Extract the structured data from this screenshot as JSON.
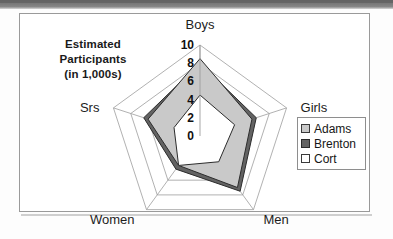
{
  "frame": {
    "border_color": "#9a9a9a",
    "background": "#ffffff"
  },
  "title": {
    "line1": "Estimated",
    "line2": "Participants",
    "line3": "(in 1,000s)"
  },
  "legend": {
    "items": [
      {
        "label": "Adams",
        "color": "#c9c9c9",
        "border": "#3a3a3a"
      },
      {
        "label": "Brenton",
        "color": "#636363",
        "border": "#2b2b2b"
      },
      {
        "label": "Cort",
        "color": "#ffffff",
        "border": "#3a3a3a"
      }
    ]
  },
  "chart_data": {
    "type": "radar",
    "title": "Estimated Participants (in 1,000s)",
    "xlabel": "",
    "ylabel": "Estimated Participants (in 1,000s)",
    "categories": [
      "Boys",
      "Girls",
      "Men",
      "Women",
      "Srs"
    ],
    "tick_labels": [
      "0",
      "2",
      "4",
      "6",
      "8",
      "10"
    ],
    "ticks": [
      0,
      2,
      4,
      6,
      8,
      10
    ],
    "rlim": [
      0,
      10
    ],
    "grid": true,
    "legend_position": "right",
    "series": [
      {
        "name": "Adams",
        "color": "#c9c9c9",
        "values": [
          8.5,
          6.0,
          7.0,
          4.0,
          6.0
        ]
      },
      {
        "name": "Brenton",
        "color": "#636363",
        "values": [
          8.0,
          6.5,
          7.5,
          4.5,
          6.5
        ]
      },
      {
        "name": "Cort",
        "color": "#ffffff",
        "values": [
          4.5,
          4.0,
          3.5,
          4.0,
          3.0
        ]
      }
    ]
  },
  "axis_labels": {
    "boys": "Boys",
    "girls": "Girls",
    "men": "Men",
    "women": "Women",
    "srs": "Srs"
  }
}
